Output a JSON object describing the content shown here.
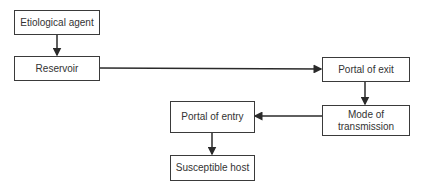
{
  "diagram": {
    "type": "flowchart",
    "title": "",
    "nodes": [
      {
        "id": "agent",
        "label": "Etiological agent"
      },
      {
        "id": "reservoir",
        "label": "Reservoir"
      },
      {
        "id": "exit",
        "label": "Portal of exit"
      },
      {
        "id": "mode",
        "label_line1": "Mode of",
        "label_line2": "transmission"
      },
      {
        "id": "entry",
        "label": "Portal of entry"
      },
      {
        "id": "host",
        "label": "Susceptible host"
      }
    ],
    "edges": [
      {
        "from": "agent",
        "to": "reservoir"
      },
      {
        "from": "reservoir",
        "to": "exit"
      },
      {
        "from": "exit",
        "to": "mode"
      },
      {
        "from": "mode",
        "to": "entry"
      },
      {
        "from": "entry",
        "to": "host"
      }
    ],
    "colors": {
      "line": "#2a2a2a",
      "border": "#3a3a3a",
      "text": "#333333"
    }
  }
}
